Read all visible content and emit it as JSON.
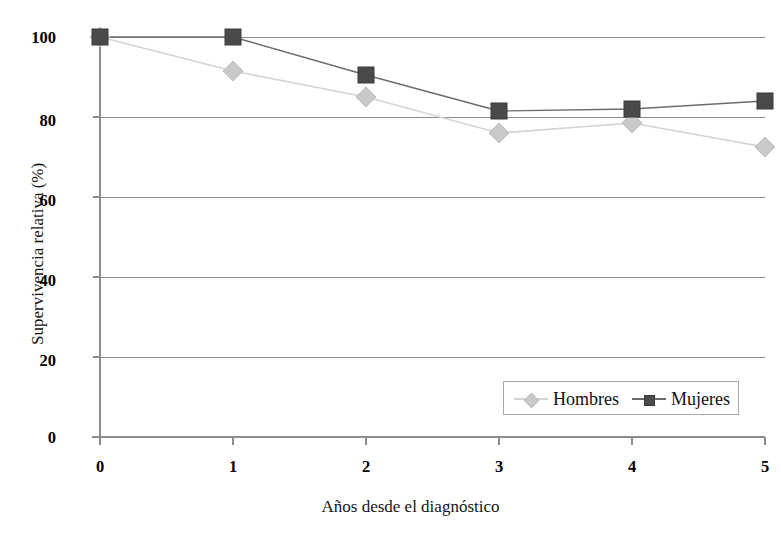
{
  "chart_data": {
    "type": "line",
    "title": "",
    "xlabel": "Años desde el diagnóstico",
    "ylabel": "Supervivencia relativa (%)",
    "x": [
      0,
      1,
      2,
      3,
      4,
      5
    ],
    "xtick_labels": [
      "0",
      "1",
      "2",
      "3",
      "4",
      "5"
    ],
    "ytick_labels": [
      "0",
      "20",
      "40",
      "60",
      "80",
      "100"
    ],
    "yticks": [
      0,
      20,
      40,
      60,
      80,
      100
    ],
    "xlim": [
      0,
      5
    ],
    "ylim": [
      0,
      100
    ],
    "grid": "horizontal",
    "legend_position": "lower-right",
    "series": [
      {
        "name": "Hombres",
        "marker": "diamond",
        "color": "#c9c9c9",
        "line_color": "#d4d4d4",
        "values": [
          100,
          91.5,
          85,
          76,
          78.5,
          72.5
        ]
      },
      {
        "name": "Mujeres",
        "marker": "square",
        "color": "#4a4a4a",
        "line_color": "#6b6b6b",
        "values": [
          100,
          100,
          90.5,
          81.5,
          82,
          84
        ]
      }
    ]
  },
  "legend": {
    "entries": [
      {
        "label": "Hombres"
      },
      {
        "label": "Mujeres"
      }
    ]
  },
  "axes": {
    "axis_color": "#8c8c8c",
    "grid_color": "#8c8c8c"
  }
}
